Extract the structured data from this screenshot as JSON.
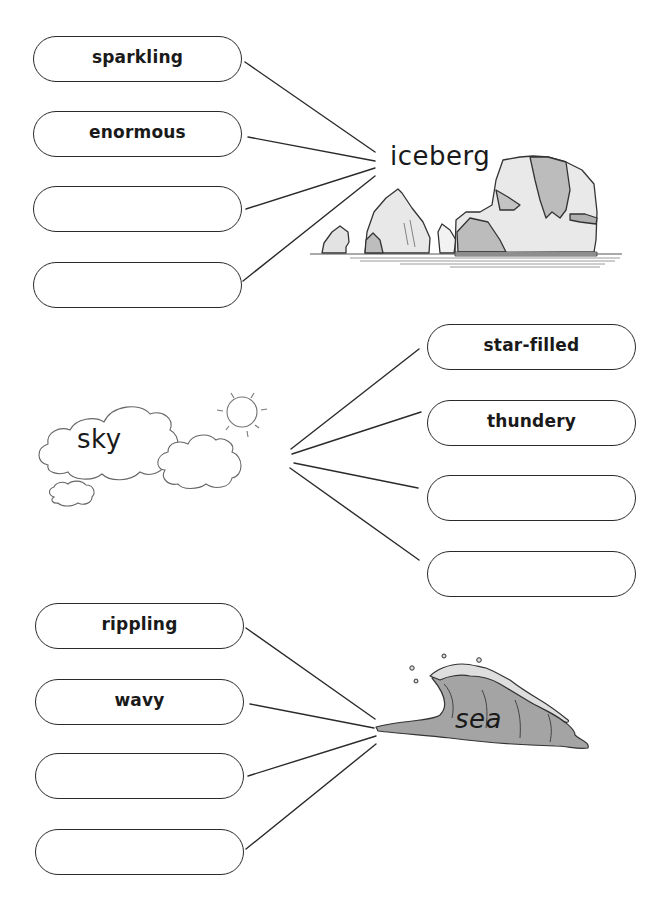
{
  "sections": [
    {
      "noun": "iceberg",
      "boxes": [
        {
          "label": "sparkling"
        },
        {
          "label": "enormous"
        },
        {
          "label": ""
        },
        {
          "label": ""
        }
      ]
    },
    {
      "noun": "sky",
      "boxes": [
        {
          "label": "star-filled"
        },
        {
          "label": "thundery"
        },
        {
          "label": ""
        },
        {
          "label": ""
        }
      ]
    },
    {
      "noun": "sea",
      "boxes": [
        {
          "label": "rippling"
        },
        {
          "label": "wavy"
        },
        {
          "label": ""
        },
        {
          "label": ""
        }
      ]
    }
  ],
  "colors": {
    "line": "#2a2a2a",
    "ice_light": "#e6e6e6",
    "ice_dark": "#b9b9b9",
    "sea_fill": "#a3a3a3",
    "foam": "#dcdcdc"
  }
}
